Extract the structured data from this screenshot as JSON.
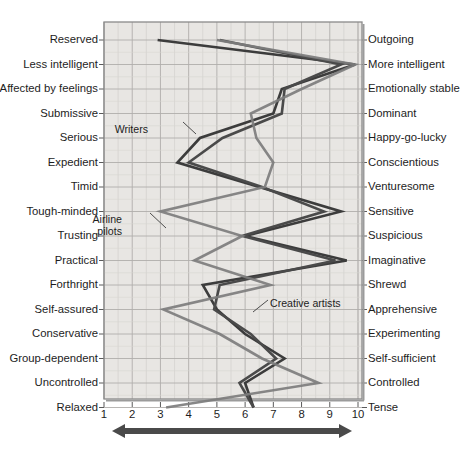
{
  "chart_data": {
    "type": "line",
    "orientation": "horizontal-profile",
    "title": "",
    "xlabel": "",
    "ylabel": "",
    "xlim": [
      1,
      10
    ],
    "grid": true,
    "xticks": [
      "1",
      "2",
      "3",
      "4",
      "5",
      "6",
      "7",
      "8",
      "9",
      "10"
    ],
    "legend_position": "inline-annotations",
    "left_labels": [
      "Reserved",
      "Less intelligent",
      "Affected by feelings",
      "Submissive",
      "Serious",
      "Expedient",
      "Timid",
      "Tough-minded",
      "Trusting",
      "Practical",
      "Forthright",
      "Self-assured",
      "Conservative",
      "Group-dependent",
      "Uncontrolled",
      "Relaxed"
    ],
    "right_labels": [
      "Outgoing",
      "More intelligent",
      "Emotionally stable",
      "Dominant",
      "Happy-go-lucky",
      "Conscientious",
      "Venturesome",
      "Sensitive",
      "Suspicious",
      "Imaginative",
      "Shrewd",
      "Apprehensive",
      "Experimenting",
      "Self-sufficient",
      "Controlled",
      "Tense"
    ],
    "series": [
      {
        "name": "Writers",
        "color": "#3c3c3c",
        "values": [
          2.9,
          9.9,
          7.3,
          7.0,
          4.4,
          3.6,
          6.5,
          9.4,
          6.0,
          9.6,
          4.5,
          5.0,
          6.0,
          7.4,
          6.0,
          6.3
        ]
      },
      {
        "name": "Creative artists",
        "color": "#4a4a4a",
        "values": [
          5.1,
          9.4,
          7.4,
          7.3,
          5.2,
          4.0,
          6.6,
          8.8,
          5.9,
          9.2,
          5.1,
          4.9,
          6.2,
          7.1,
          5.8,
          6.3
        ]
      },
      {
        "name": "Airline pilots",
        "color": "#7d7d7d",
        "values": [
          5.0,
          9.9,
          8.0,
          6.2,
          6.4,
          7.0,
          6.7,
          3.0,
          5.9,
          4.2,
          6.9,
          3.1,
          5.1,
          6.6,
          8.6,
          3.2
        ]
      }
    ],
    "annotations": [
      {
        "text": "Writers",
        "x": 148,
        "y": 124
      },
      {
        "text": "Airline",
        "x": 122,
        "y": 214
      },
      {
        "text": "pilots",
        "x": 122,
        "y": 226
      },
      {
        "text": "Creative artists",
        "x": 270,
        "y": 298
      }
    ]
  },
  "axis_arrow": {
    "name": "bidirectional-axis-arrow",
    "color": "#4a4a4a"
  },
  "colors": {
    "plot_background": "#e8e6e3",
    "grid": "#b0aeab",
    "border": "#8a8a8a",
    "text": "#1d1d1d"
  }
}
